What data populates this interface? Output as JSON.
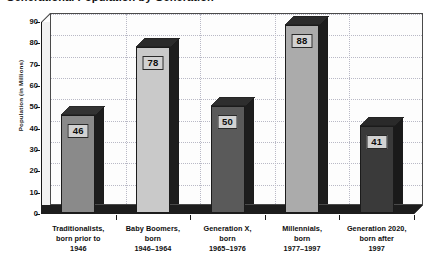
{
  "chart_data": {
    "type": "bar",
    "title": "Generational Population by Generation",
    "title_note": "cropped at top of screenshot",
    "xlabel": "",
    "ylabel": "Population (in Millions)",
    "ylim": [
      0,
      90
    ],
    "ytick_step": 10,
    "yticks": [
      "90",
      "80",
      "70",
      "60",
      "50",
      "40",
      "30",
      "20",
      "10",
      "0"
    ],
    "grid": true,
    "legend": "none",
    "style": "3d-bar-grayscale",
    "categories": [
      "Traditionalists, born prior to 1946",
      "Baby Boomers, born 1946–1964",
      "Generation X, born 1965–1976",
      "Millennials, born 1977–1997",
      "Generation 2020, born after 1997"
    ],
    "values": [
      46,
      78,
      50,
      88,
      41
    ],
    "bars": [
      {
        "label_lines": [
          "Traditionalists,",
          "born prior to",
          "1946"
        ],
        "value": 46,
        "value_text": "46",
        "face_color": "#8a8a8a",
        "side_color": "#1d1d1d",
        "top_color": "#333333"
      },
      {
        "label_lines": [
          "Baby Boomers,",
          "born",
          "1946–1964"
        ],
        "value": 78,
        "value_text": "78",
        "face_color": "#c9c9c9",
        "side_color": "#1d1d1d",
        "top_color": "#2b2b2b"
      },
      {
        "label_lines": [
          "Generation X,",
          "born",
          "1965–1976"
        ],
        "value": 50,
        "value_text": "50",
        "face_color": "#5a5a5a",
        "side_color": "#1d1d1d",
        "top_color": "#2e2e2e"
      },
      {
        "label_lines": [
          "Millennials,",
          "born",
          "1977–1997"
        ],
        "value": 88,
        "value_text": "88",
        "face_color": "#ababab",
        "side_color": "#1d1d1d",
        "top_color": "#2b2b2b"
      },
      {
        "label_lines": [
          "Generation 2020,",
          "born after",
          "1997"
        ],
        "value": 41,
        "value_text": "41",
        "face_color": "#3a3a3a",
        "side_color": "#1a1a1a",
        "top_color": "#2a2a2a"
      }
    ],
    "colors": {
      "plot_background": "#fdfdfd",
      "page_background": "#ffffff",
      "gridline": "#b9b9c6",
      "axis": "#1a1a1a",
      "floor": "#1d1d1d",
      "value_box_fill": "#d2d2d2",
      "text": "#0f0f0f"
    }
  }
}
